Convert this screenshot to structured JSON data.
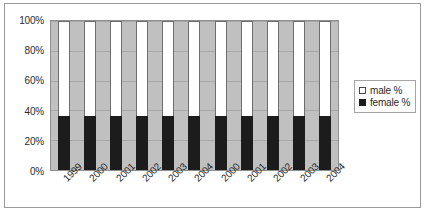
{
  "chart_data": {
    "type": "bar",
    "subtype": "100% stacked column",
    "title": "",
    "xlabel": "",
    "ylabel": "",
    "ylim": [
      0,
      100
    ],
    "yticks": [
      0,
      20,
      40,
      60,
      80,
      100
    ],
    "ytick_labels": [
      "0%",
      "20%",
      "40%",
      "60%",
      "80%",
      "100%"
    ],
    "grid": true,
    "legend_position": "right",
    "categories": [
      "1999",
      "2000",
      "2001",
      "2002",
      "2003",
      "2004",
      "2000",
      "2001",
      "2002",
      "2003",
      "2004"
    ],
    "series": [
      {
        "name": "male %",
        "color": "#ffffff",
        "values": [
          64,
          64,
          64,
          64,
          64,
          64,
          64,
          64,
          64,
          64,
          64
        ]
      },
      {
        "name": "female %",
        "color": "#1c1c1c",
        "values": [
          36,
          36,
          36,
          36,
          36,
          36,
          36,
          36,
          36,
          36,
          36
        ]
      }
    ]
  },
  "legend": {
    "items": [
      {
        "label": "male %",
        "swatch": "male"
      },
      {
        "label": "female %",
        "swatch": "female"
      }
    ]
  },
  "colors": {
    "plot_background": "#c0c0c0",
    "male_fill": "#ffffff",
    "female_fill": "#1c1c1c",
    "frame_border": "#9a9a9a",
    "gridline": "#a8a8a8"
  }
}
